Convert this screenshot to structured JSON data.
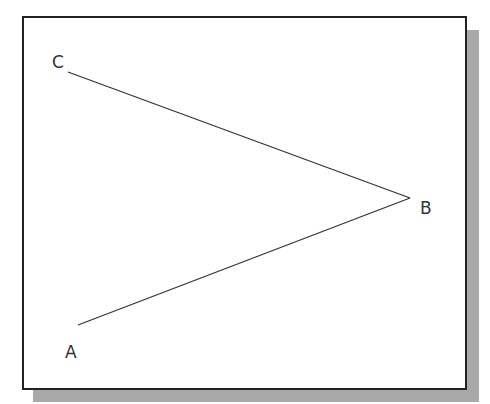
{
  "diagram": {
    "type": "angle",
    "points": {
      "A": {
        "label": "A",
        "x": 78,
        "y": 325
      },
      "B": {
        "label": "B",
        "x": 410,
        "y": 198
      },
      "C": {
        "label": "C",
        "x": 68,
        "y": 72
      }
    },
    "segments": [
      {
        "from": "C",
        "to": "B"
      },
      {
        "from": "A",
        "to": "B"
      }
    ],
    "labels": {
      "A": "A",
      "B": "B",
      "C": "C"
    },
    "colors": {
      "line": "#333333",
      "border": "#222222",
      "shadow": "#a9a9a9",
      "background": "#ffffff"
    }
  }
}
